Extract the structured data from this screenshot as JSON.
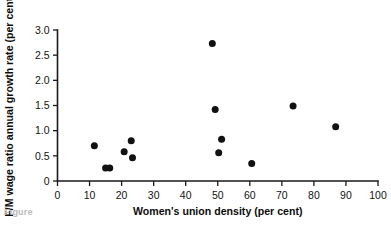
{
  "chart_data": {
    "type": "scatter",
    "title": "",
    "xlabel": "Women's union density (per cent)",
    "ylabel": "F/M wage ratio annual growth rate (per cent)",
    "xlim": [
      0,
      100
    ],
    "ylim": [
      0,
      3.0
    ],
    "xticks": [
      0,
      10,
      20,
      30,
      40,
      50,
      60,
      70,
      80,
      90,
      100
    ],
    "yticks": [
      0,
      0.5,
      1.0,
      1.5,
      2.0,
      2.5,
      3.0
    ],
    "xtick_labels": [
      "0",
      "10",
      "20",
      "30",
      "40",
      "50",
      "60",
      "70",
      "80",
      "90",
      "100"
    ],
    "ytick_labels": [
      "0",
      "0.5",
      "1.0",
      "1.5",
      "2.0",
      "2.5",
      "3.0"
    ],
    "grid": false,
    "legend": null,
    "marker": "filled-circle",
    "marker_color": "#111111",
    "x": [
      11.5,
      15.0,
      16.3,
      20.8,
      23.0,
      23.4,
      48.3,
      49.2,
      50.3,
      51.2,
      60.6,
      73.5,
      86.8
    ],
    "y": [
      0.7,
      0.26,
      0.26,
      0.58,
      0.8,
      0.46,
      2.73,
      1.42,
      0.56,
      0.83,
      0.35,
      1.49,
      1.08
    ],
    "points": [
      {
        "x": 11.5,
        "y": 0.7
      },
      {
        "x": 15.0,
        "y": 0.26
      },
      {
        "x": 16.3,
        "y": 0.26
      },
      {
        "x": 20.8,
        "y": 0.58
      },
      {
        "x": 23.0,
        "y": 0.8
      },
      {
        "x": 23.4,
        "y": 0.46
      },
      {
        "x": 48.3,
        "y": 2.73
      },
      {
        "x": 49.2,
        "y": 1.42
      },
      {
        "x": 50.3,
        "y": 0.56
      },
      {
        "x": 51.2,
        "y": 0.83
      },
      {
        "x": 60.6,
        "y": 0.35
      },
      {
        "x": 73.5,
        "y": 1.49
      },
      {
        "x": 86.8,
        "y": 1.08
      }
    ]
  },
  "caption": {
    "fragment": "Figure"
  }
}
